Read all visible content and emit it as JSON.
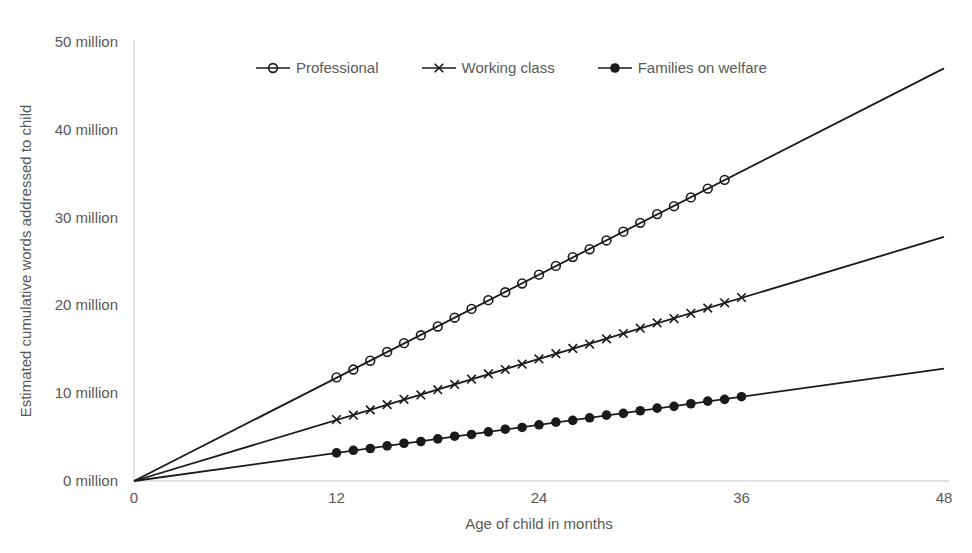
{
  "figure": {
    "background": "#ffffff",
    "text_color": "#595959",
    "line_color": "#1a1a1a",
    "axis_color": "#d9d9d9"
  },
  "chart_data": {
    "type": "line",
    "title": "",
    "xlabel": "Age of child in months",
    "ylabel": "Estimated cumulative words addressed to child",
    "xlim": [
      0,
      48
    ],
    "ylim": [
      0,
      50
    ],
    "x_ticks": [
      0,
      12,
      24,
      36,
      48
    ],
    "x_tick_labels": [
      "0",
      "12",
      "24",
      "36",
      "48"
    ],
    "y_ticks": [
      0,
      10,
      20,
      30,
      40,
      50
    ],
    "y_tick_labels": [
      "0 million",
      "10 million",
      "20 million",
      "30 million",
      "40 million",
      "50 million"
    ],
    "grid": false,
    "legend_position": "top",
    "series": [
      {
        "name": "Professional",
        "marker": "open-circle",
        "slope_millions_per_month": 0.979,
        "line_points": [
          [
            0,
            0
          ],
          [
            48,
            47.0
          ]
        ],
        "points": [
          [
            12,
            11.8
          ],
          [
            13,
            12.7
          ],
          [
            14,
            13.7
          ],
          [
            15,
            14.7
          ],
          [
            16,
            15.7
          ],
          [
            17,
            16.6
          ],
          [
            18,
            17.6
          ],
          [
            19,
            18.6
          ],
          [
            20,
            19.6
          ],
          [
            21,
            20.6
          ],
          [
            22,
            21.5
          ],
          [
            23,
            22.5
          ],
          [
            24,
            23.5
          ],
          [
            25,
            24.5
          ],
          [
            26,
            25.5
          ],
          [
            27,
            26.4
          ],
          [
            28,
            27.4
          ],
          [
            29,
            28.4
          ],
          [
            30,
            29.4
          ],
          [
            31,
            30.4
          ],
          [
            32,
            31.3
          ],
          [
            33,
            32.3
          ],
          [
            34,
            33.3
          ],
          [
            35,
            34.3
          ]
        ]
      },
      {
        "name": "Working class",
        "marker": "x",
        "slope_millions_per_month": 0.579,
        "line_points": [
          [
            0,
            0
          ],
          [
            48,
            27.8
          ]
        ],
        "points": [
          [
            12,
            7.0
          ],
          [
            13,
            7.5
          ],
          [
            14,
            8.1
          ],
          [
            15,
            8.7
          ],
          [
            16,
            9.3
          ],
          [
            17,
            9.8
          ],
          [
            18,
            10.4
          ],
          [
            19,
            11.0
          ],
          [
            20,
            11.6
          ],
          [
            21,
            12.2
          ],
          [
            22,
            12.7
          ],
          [
            23,
            13.3
          ],
          [
            24,
            13.9
          ],
          [
            25,
            14.5
          ],
          [
            26,
            15.1
          ],
          [
            27,
            15.6
          ],
          [
            28,
            16.2
          ],
          [
            29,
            16.8
          ],
          [
            30,
            17.4
          ],
          [
            31,
            18.0
          ],
          [
            32,
            18.5
          ],
          [
            33,
            19.1
          ],
          [
            34,
            19.7
          ],
          [
            35,
            20.3
          ],
          [
            36,
            20.9
          ]
        ]
      },
      {
        "name": "Families on welfare",
        "marker": "filled-circle",
        "slope_millions_per_month": 0.267,
        "line_points": [
          [
            0,
            0
          ],
          [
            48,
            12.8
          ]
        ],
        "points": [
          [
            12,
            3.2
          ],
          [
            13,
            3.5
          ],
          [
            14,
            3.7
          ],
          [
            15,
            4.0
          ],
          [
            16,
            4.3
          ],
          [
            17,
            4.5
          ],
          [
            18,
            4.8
          ],
          [
            19,
            5.1
          ],
          [
            20,
            5.3
          ],
          [
            21,
            5.6
          ],
          [
            22,
            5.9
          ],
          [
            23,
            6.1
          ],
          [
            24,
            6.4
          ],
          [
            25,
            6.7
          ],
          [
            26,
            6.9
          ],
          [
            27,
            7.2
          ],
          [
            28,
            7.5
          ],
          [
            29,
            7.7
          ],
          [
            30,
            8.0
          ],
          [
            31,
            8.3
          ],
          [
            32,
            8.5
          ],
          [
            33,
            8.8
          ],
          [
            34,
            9.1
          ],
          [
            35,
            9.3
          ],
          [
            36,
            9.6
          ]
        ]
      }
    ]
  }
}
